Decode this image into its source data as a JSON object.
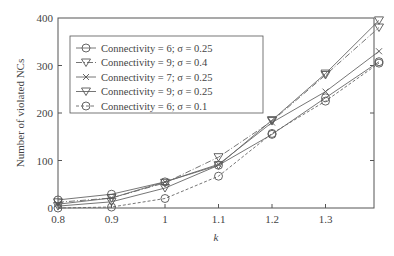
{
  "chart_data": {
    "type": "line",
    "title": "",
    "xlabel": "k",
    "ylabel": "Number of violated NCs",
    "x": [
      0.8,
      0.9,
      1.0,
      1.1,
      1.2,
      1.3,
      1.4
    ],
    "x_tick_labels": [
      "0.8",
      "0.9",
      "1",
      "1.1",
      "1.2",
      "1.3"
    ],
    "y_tick_labels": [
      "0",
      "100",
      "200",
      "300",
      "400"
    ],
    "xlim": [
      0.8,
      1.4
    ],
    "ylim": [
      0,
      400
    ],
    "grid": false,
    "legend_position": "upper left",
    "series": [
      {
        "name": "Connectivity = 6; σ = 0.25",
        "marker": "circle",
        "dash": "solid",
        "values": [
          17,
          29,
          55,
          90,
          155,
          232,
          308
        ]
      },
      {
        "name": "Connectivity = 9; σ = 0.4",
        "marker": "triangle-down",
        "dash": "dashdot",
        "values": [
          12,
          21,
          53,
          107,
          183,
          280,
          380
        ]
      },
      {
        "name": "Connectivity = 7; σ = 0.25",
        "marker": "x",
        "dash": "solid",
        "values": [
          8,
          21,
          55,
          92,
          180,
          245,
          330
        ]
      },
      {
        "name": "Connectivity = 9; σ = 0.25",
        "marker": "triangle-down",
        "dash": "solid",
        "values": [
          4,
          13,
          42,
          90,
          185,
          283,
          395
        ]
      },
      {
        "name": "Connectivity = 6; σ = 0.1",
        "marker": "circle",
        "dash": "dashed",
        "values": [
          0,
          2,
          20,
          67,
          157,
          225,
          305
        ]
      }
    ]
  },
  "legend": {
    "items": [
      "Connectivity = 6; σ = 0.25",
      "Connectivity = 9; σ = 0.4",
      "Connectivity = 7; σ = 0.25",
      "Connectivity = 9; σ = 0.25",
      "Connectivity = 6; σ = 0.1"
    ]
  }
}
